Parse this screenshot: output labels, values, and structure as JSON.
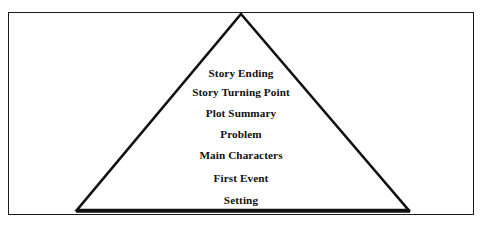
{
  "figure": {
    "type": "story-plot-triangle-diagram",
    "background_color": "#ffffff",
    "frame": {
      "border_color": "#1b1b1b",
      "fill_color": "#ffffff"
    },
    "triangle": {
      "outline_color": "#111111",
      "fill_color": "#ffffff",
      "base_color": "#111111",
      "apex": "top-center",
      "base": "bottom"
    },
    "labels": [
      {
        "text": "Story Ending",
        "y": 67
      },
      {
        "text": "Story Turning Point",
        "y": 86
      },
      {
        "text": "Plot Summary",
        "y": 107
      },
      {
        "text": "Problem",
        "y": 128
      },
      {
        "text": "Main Characters",
        "y": 149
      },
      {
        "text": "First Event",
        "y": 172
      },
      {
        "text": "Setting",
        "y": 194
      }
    ]
  }
}
